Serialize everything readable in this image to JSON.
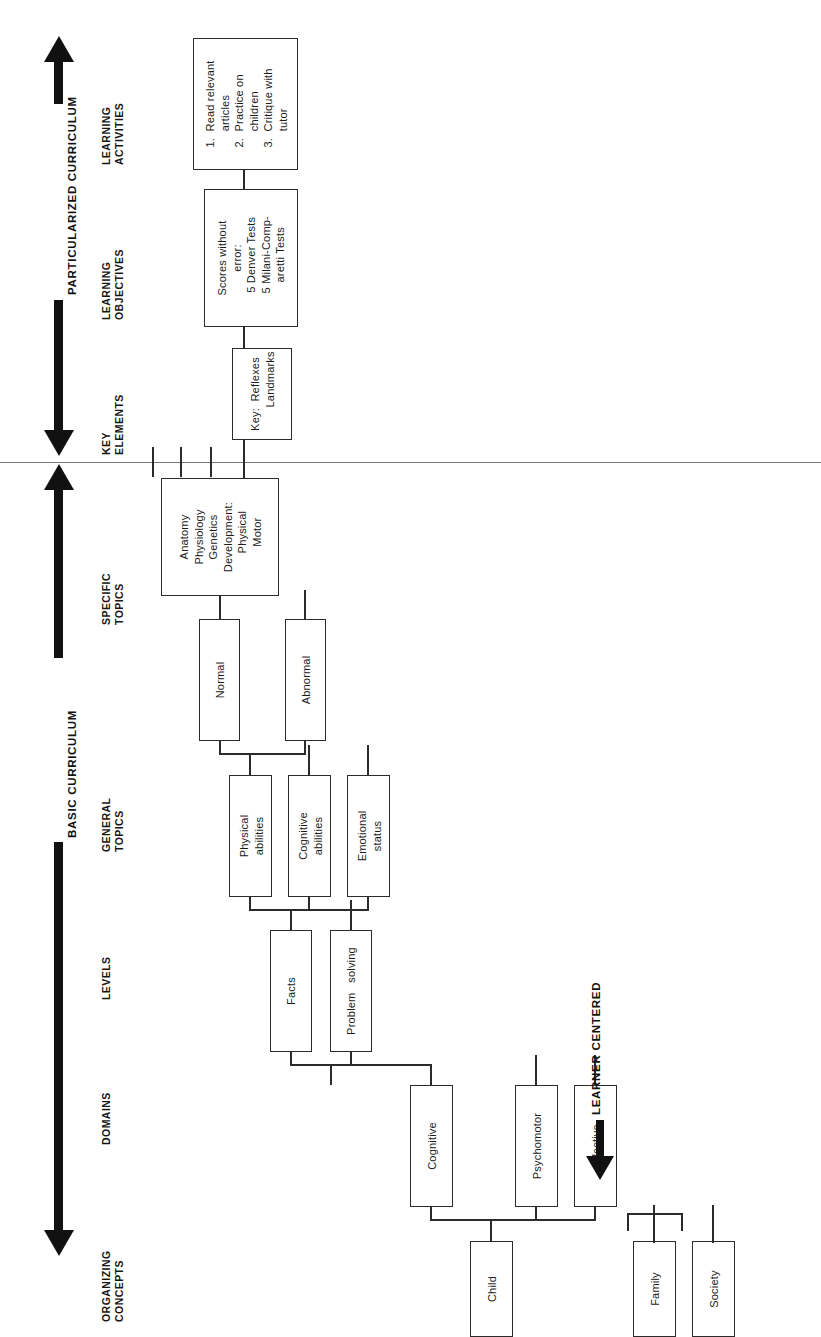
{
  "figure": {
    "orientation": "rotated-90-ccw",
    "axis_top_label": "PARTICULARIZED CURRICULUM",
    "axis_mid_label": "BASIC CURRICULUM",
    "axis_bottom_label": "LEARNER CENTERED"
  },
  "columns": [
    {
      "key": "learning_activities",
      "label": "LEARNING\nACTIVITIES"
    },
    {
      "key": "learning_objectives",
      "label": "LEARNING\nOBJECTIVES"
    },
    {
      "key": "key_elements",
      "label": "KEY\nELEMENTS"
    },
    {
      "key": "specific_topics",
      "label": "SPECIFIC\nTOPICS"
    },
    {
      "key": "general_topics",
      "label": "GENERAL\nTOPICS"
    },
    {
      "key": "levels",
      "label": "LEVELS"
    },
    {
      "key": "domains",
      "label": "DOMAINS"
    },
    {
      "key": "organizing_concepts",
      "label": "ORGANIZING\nCONCEPTS"
    }
  ],
  "nodes": {
    "learning_activities": "1.  Read relevant\n     articles\n2.  Practice on\n     children\n3.  Critique with\n     tutor",
    "learning_objectives": "Scores without\nerror:\n  5 Denver Tests\n  5 Milani-Comp-\n  aretti Tests",
    "key_elements": "Key:  Reflexes\n         Landmarks",
    "specific_topics": "Anatomy\nPhysiology\nGenetics\nDevelopment:\n   Physical\n   Motor",
    "normal": "Normal",
    "abnormal": "Abnormal",
    "physical_abilities": "Physical\nabilities",
    "cognitive_abilities": "Cognitive\nabilities",
    "emotional_status": "Emotional\nstatus",
    "facts": "Facts",
    "problem_solving": "Problem   solving",
    "cognitive": "Cognitive",
    "psychomotor": "Psychomotor",
    "affective": "Affective",
    "child": "Child",
    "family": "Family",
    "society": "Society"
  },
  "colors": {
    "ink": "#2b2b2b",
    "arrow": "#111111",
    "divider": "#7a7a7a",
    "background": "#ffffff"
  }
}
